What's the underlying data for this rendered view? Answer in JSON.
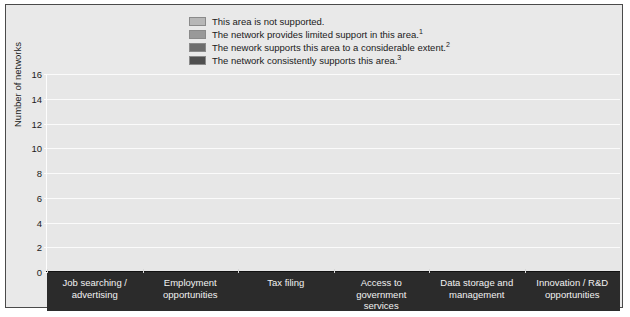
{
  "chart_data": {
    "type": "bar",
    "title": "",
    "subtitle": "",
    "xlabel": "",
    "ylabel": "Number of networks",
    "ylim": [
      0,
      16
    ],
    "ytick_step": 2,
    "yticks": [
      0,
      2,
      4,
      6,
      8,
      10,
      12,
      14,
      16
    ],
    "grid": true,
    "legend_position": "top-center",
    "categories": [
      "Job searching /\nadvertising",
      "Employment\nopportunities",
      "Tax filing",
      "Access to\ngovernment\nservices",
      "Data storage and\nmanagement",
      "Innovation / R&D\nopportunities"
    ],
    "series": [
      {
        "name": "This area is not supported.",
        "color": "#b7b7b7",
        "values": [
          1,
          1,
          14,
          4,
          13,
          11
        ]
      },
      {
        "name": "The network provides limited support in this area.¹",
        "color": "#999999",
        "values": [
          5,
          6,
          1,
          4,
          4,
          5
        ]
      },
      {
        "name": "The nework supports this area to a considerable extent.²",
        "color": "#6d6d6d",
        "values": [
          7,
          8,
          0,
          5,
          1,
          2
        ]
      },
      {
        "name": "The network consistently supports this area.³",
        "color": "#4f4f4f",
        "values": [
          6,
          5,
          4,
          6,
          2,
          1
        ]
      }
    ]
  },
  "legend": {
    "items": [
      {
        "label": "This area is not supported.",
        "label_sup": "",
        "color": "#b7b7b7"
      },
      {
        "label": "The network provides limited support in this area.",
        "label_sup": "1",
        "color": "#999999"
      },
      {
        "label": "The nework supports this area to a considerable extent.",
        "label_sup": "2",
        "color": "#6d6d6d"
      },
      {
        "label": "The network consistently supports this area.",
        "label_sup": "3",
        "color": "#4f4f4f"
      }
    ]
  },
  "yaxis": {
    "title": "Number of networks",
    "tick_labels": [
      "16",
      "14",
      "12",
      "10",
      "8",
      "6",
      "4",
      "2",
      "0"
    ]
  },
  "xaxis": {
    "tick_labels": [
      "Job searching /\nadvertising",
      "Employment\nopportunities",
      "Tax filing",
      "Access to\ngovernment\nservices",
      "Data storage and\nmanagement",
      "Innovation / R&D\nopportunities"
    ]
  },
  "colors": {
    "frame_background": "#e9e9e9",
    "plot_background": "#e7e7e7",
    "gridline": "#fbfbfb",
    "axis_band": "#2b2b2b",
    "axis_band_text": "#f2f2f2",
    "frame_border": "#4a4a4a"
  }
}
